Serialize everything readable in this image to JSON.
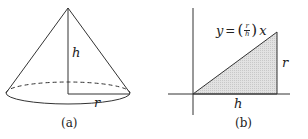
{
  "figure_a": {
    "caption": "(a)",
    "labels": {
      "height": "h",
      "radius": "r"
    }
  },
  "figure_b": {
    "caption": "(b)",
    "labels": {
      "base": "h",
      "side": "r"
    },
    "equation": {
      "lhs": "y",
      "equals": "=",
      "num": "r",
      "den": "h",
      "var": "x",
      "open": "(",
      "close": ")"
    }
  },
  "colors": {
    "stroke": "#333333",
    "fill": "#dcdcdc"
  }
}
